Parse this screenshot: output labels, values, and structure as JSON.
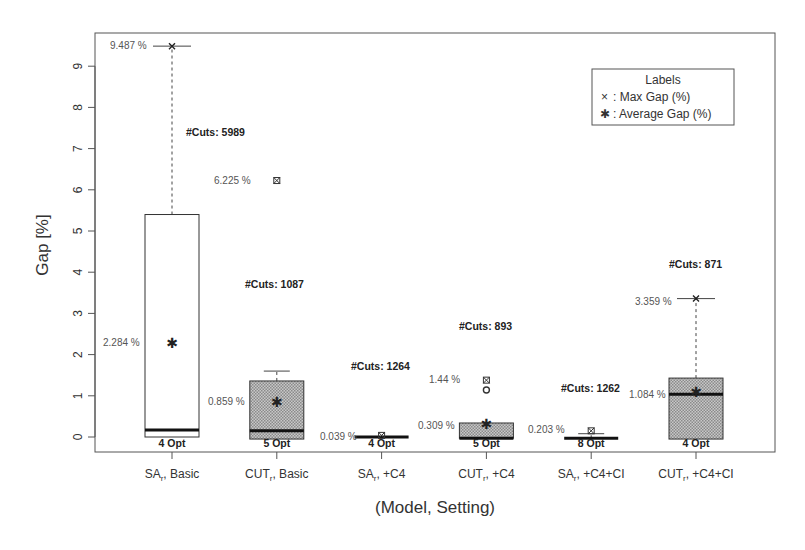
{
  "chart_data": {
    "type": "box",
    "title": "",
    "xlabel": "(Model, Setting)",
    "ylabel": "Gap [%]",
    "ylim": [
      -0.3,
      9.8
    ],
    "yticks": [
      0,
      1,
      2,
      3,
      4,
      5,
      6,
      7,
      8,
      9
    ],
    "grid": false,
    "legend": {
      "title": "Labels",
      "position": "top-right",
      "entries": [
        {
          "symbol": "×",
          "label": ": Max Gap (%)"
        },
        {
          "symbol": "✱",
          "label": ": Average Gap (%)"
        }
      ]
    },
    "categories": [
      {
        "model": "SA",
        "sub": "r",
        "setting": "Basic"
      },
      {
        "model": "CUT",
        "sub": "r",
        "setting": "Basic"
      },
      {
        "model": "SA",
        "sub": "r",
        "setting": "+C4"
      },
      {
        "model": "CUT",
        "sub": "r",
        "setting": "+C4"
      },
      {
        "model": "SA",
        "sub": "r",
        "setting": "+C4+CI"
      },
      {
        "model": "CUT",
        "sub": "r",
        "setting": "+C4+CI"
      }
    ],
    "boxes": [
      {
        "q1": 0.0,
        "median": 0.17,
        "q3": 5.4,
        "whisker_low": 0.0,
        "whisker_high": 9.487,
        "max_gap": 9.487,
        "max_label": "9.487 %",
        "mean": 2.284,
        "mean_label": "2.284 %",
        "outliers": [],
        "max_is_outlier": false,
        "cuts": "#Cuts:  5989",
        "opt": "4 Opt",
        "shaded": false
      },
      {
        "q1": -0.05,
        "median": 0.15,
        "q3": 1.36,
        "whisker_low": -0.05,
        "whisker_high": 1.6,
        "max_gap": 6.225,
        "max_label": "6.225 %",
        "mean": 0.859,
        "mean_label": "0.859 %",
        "outliers": [],
        "max_is_outlier": true,
        "cuts": "#Cuts:  1087",
        "opt": "5 Opt",
        "shaded": true
      },
      {
        "q1": 0.0,
        "median": 0.0,
        "q3": 0.0,
        "whisker_low": 0.0,
        "whisker_high": 0.0,
        "max_gap": 0.039,
        "max_label": "0.039 %",
        "mean": 0.0,
        "mean_label": "0.039 %",
        "outliers": [],
        "max_is_outlier": true,
        "cuts": "#Cuts:  1264",
        "opt": "4 Opt",
        "shaded": false
      },
      {
        "q1": -0.03,
        "median": -0.03,
        "q3": 0.34,
        "whisker_low": -0.03,
        "whisker_high": 0.34,
        "max_gap": 1.38,
        "max_label": "1.44 %",
        "mean": 0.309,
        "mean_label": "0.309 %",
        "outliers": [
          1.14
        ],
        "max_is_outlier": true,
        "cuts": "#Cuts:  893",
        "opt": "5 Opt",
        "shaded": true
      },
      {
        "q1": -0.03,
        "median": -0.03,
        "q3": -0.03,
        "whisker_low": -0.03,
        "whisker_high": 0.08,
        "max_gap": 0.15,
        "max_label": "0.203 %",
        "mean": 0.0,
        "mean_label": "0.203 %",
        "outliers": [],
        "max_is_outlier": true,
        "cuts": "#Cuts:  1262",
        "opt": "8 Opt",
        "shaded": false
      },
      {
        "q1": -0.05,
        "median": 1.04,
        "q3": 1.43,
        "whisker_low": -0.05,
        "whisker_high": 3.359,
        "max_gap": 3.359,
        "max_label": "3.359 %",
        "mean": 1.084,
        "mean_label": "1.084 %",
        "outliers": [],
        "max_is_outlier": false,
        "cuts": "#Cuts:  871",
        "opt": "4 Opt",
        "shaded": true
      }
    ],
    "annotations": {
      "max_labels": [
        "9.487 %",
        "6.225 %",
        "1.44 %",
        "3.359 %"
      ],
      "mean_labels": [
        "2.284 %",
        "0.859 %",
        "0.039 %",
        "0.309 %",
        "0.203 %",
        "1.084 %"
      ],
      "cuts": [
        "#Cuts:  5989",
        "#Cuts:  1087",
        "#Cuts:  1264",
        "#Cuts:  893",
        "#Cuts:  1262",
        "#Cuts:  871"
      ],
      "opt": [
        "4 Opt",
        "5 Opt",
        "4 Opt",
        "5 Opt",
        "8 Opt",
        "4 Opt"
      ]
    }
  }
}
